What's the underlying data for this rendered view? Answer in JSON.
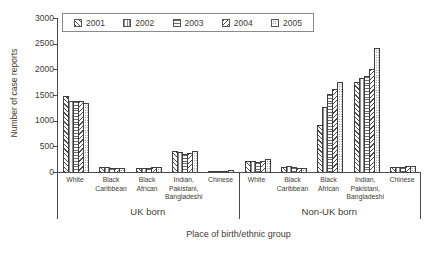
{
  "chart_data": {
    "type": "bar",
    "title": "",
    "xlabel": "Place of birth/ethnic group",
    "ylabel": "Number of case reports",
    "ylim": [
      0,
      3000
    ],
    "y_ticks": [
      0,
      500,
      1000,
      1500,
      2000,
      2500,
      3000
    ],
    "grid": false,
    "legend_position": "top",
    "series_names": [
      "2001",
      "2002",
      "2003",
      "2004",
      "2005"
    ],
    "series_patterns": [
      "diagonal-forward-hatch",
      "vertical-line-hatch",
      "horizontal-line-hatch",
      "diagonal-back-hatch",
      "dot-hatch"
    ],
    "groups": [
      {
        "label": "UK born",
        "categories": [
          {
            "label_lines": [
              "White"
            ],
            "values": [
              1490,
              1375,
              1385,
              1385,
              1340
            ]
          },
          {
            "label_lines": [
              "Black",
              "Caribbean"
            ],
            "values": [
              95,
              90,
              75,
              80,
              85
            ]
          },
          {
            "label_lines": [
              "Black",
              "African"
            ],
            "values": [
              70,
              75,
              75,
              100,
              95
            ]
          },
          {
            "label_lines": [
              "Indian,",
              "Pakistani,",
              "Bangladeshi"
            ],
            "values": [
              400,
              395,
              350,
              375,
              410
            ]
          },
          {
            "label_lines": [
              "Chinese"
            ],
            "values": [
              5,
              5,
              10,
              25,
              35
            ]
          }
        ]
      },
      {
        "label": "Non-UK born",
        "categories": [
          {
            "label_lines": [
              "White"
            ],
            "values": [
              220,
              205,
              195,
              210,
              250
            ]
          },
          {
            "label_lines": [
              "Black",
              "Caribbean"
            ],
            "values": [
              100,
              110,
              100,
              85,
              70
            ]
          },
          {
            "label_lines": [
              "Black",
              "African"
            ],
            "values": [
              915,
              1265,
              1525,
              1620,
              1750
            ]
          },
          {
            "label_lines": [
              "Indian,",
              "Pakistani,",
              "Bangladeshi"
            ],
            "values": [
              1760,
              1840,
              1870,
              2000,
              2420
            ]
          },
          {
            "label_lines": [
              "Chinese"
            ],
            "values": [
              100,
              105,
              100,
              110,
              115
            ]
          }
        ]
      }
    ],
    "colors": {
      "axis": "#4a4a4a",
      "text": "#3f3b36",
      "bar_outline": "#3f3f3f",
      "legend_border": "#8a8a8a"
    }
  }
}
